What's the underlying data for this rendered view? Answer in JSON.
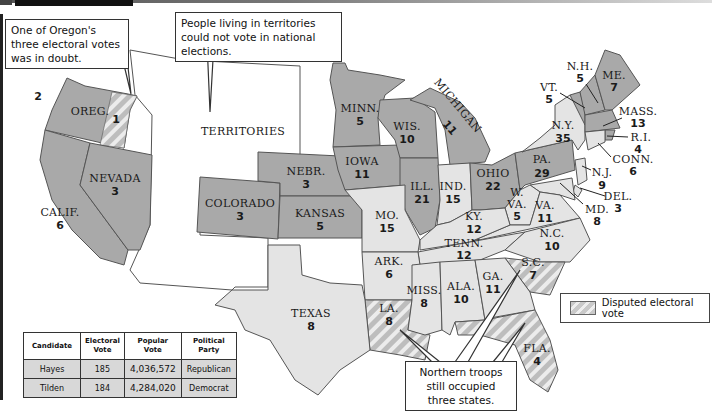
{
  "callouts": {
    "oregon": "One of Oregon's three electoral votes was in doubt.",
    "territories": "People living in territories could not vote in national elections.",
    "troops": "Northern troops still occupied three states."
  },
  "legend": {
    "label": "Disputed electoral vote",
    "swatch": "diagonal-stripe-pattern"
  },
  "colors": {
    "hayes_states": "#a9a9a9",
    "tilden_states": "#e4e4e4",
    "territories": "#ffffff",
    "disputed_stripe": "#c9c9c9"
  },
  "map": {
    "territories_label": "TERRITORIES",
    "states": [
      {
        "abbr": "OREG.",
        "votes": "2",
        "disputed_votes": "1",
        "winner": "Hayes"
      },
      {
        "abbr": "CALIF.",
        "votes": "6",
        "winner": "Hayes"
      },
      {
        "abbr": "NEVADA",
        "votes": "3",
        "winner": "Hayes"
      },
      {
        "abbr": "COLORADO",
        "votes": "3",
        "winner": "Hayes"
      },
      {
        "abbr": "NEBR.",
        "votes": "3",
        "winner": "Hayes"
      },
      {
        "abbr": "KANSAS",
        "votes": "5",
        "winner": "Hayes"
      },
      {
        "abbr": "TEXAS",
        "votes": "8",
        "winner": "Tilden"
      },
      {
        "abbr": "MINN.",
        "votes": "5",
        "winner": "Hayes"
      },
      {
        "abbr": "IOWA",
        "votes": "11",
        "winner": "Hayes"
      },
      {
        "abbr": "MO.",
        "votes": "15",
        "winner": "Tilden"
      },
      {
        "abbr": "ARK.",
        "votes": "6",
        "winner": "Tilden"
      },
      {
        "abbr": "LA.",
        "votes": "8",
        "winner": "Disputed"
      },
      {
        "abbr": "WIS.",
        "votes": "10",
        "winner": "Hayes"
      },
      {
        "abbr": "ILL.",
        "votes": "21",
        "winner": "Hayes"
      },
      {
        "abbr": "MICHIGAN",
        "votes": "11",
        "winner": "Hayes"
      },
      {
        "abbr": "IND.",
        "votes": "15",
        "winner": "Tilden"
      },
      {
        "abbr": "OHIO",
        "votes": "22",
        "winner": "Hayes"
      },
      {
        "abbr": "KY.",
        "votes": "12",
        "winner": "Tilden"
      },
      {
        "abbr": "TENN.",
        "votes": "12",
        "winner": "Tilden"
      },
      {
        "abbr": "MISS.",
        "votes": "8",
        "winner": "Tilden"
      },
      {
        "abbr": "ALA.",
        "votes": "10",
        "winner": "Tilden"
      },
      {
        "abbr": "GA.",
        "votes": "11",
        "winner": "Tilden"
      },
      {
        "abbr": "FLA.",
        "votes": "4",
        "winner": "Disputed"
      },
      {
        "abbr": "S.C.",
        "votes": "7",
        "winner": "Disputed"
      },
      {
        "abbr": "N.C.",
        "votes": "10",
        "winner": "Tilden"
      },
      {
        "abbr": "VA.",
        "votes": "11",
        "winner": "Tilden"
      },
      {
        "abbr": "W. VA.",
        "votes": "5",
        "winner": "Tilden"
      },
      {
        "abbr": "MD.",
        "votes": "8",
        "winner": "Tilden"
      },
      {
        "abbr": "DEL.",
        "votes": "3",
        "winner": "Tilden"
      },
      {
        "abbr": "PA.",
        "votes": "29",
        "winner": "Hayes"
      },
      {
        "abbr": "N.J.",
        "votes": "9",
        "winner": "Tilden"
      },
      {
        "abbr": "N.Y.",
        "votes": "35",
        "winner": "Tilden"
      },
      {
        "abbr": "CONN.",
        "votes": "6",
        "winner": "Tilden"
      },
      {
        "abbr": "R.I.",
        "votes": "4",
        "winner": "Hayes"
      },
      {
        "abbr": "MASS.",
        "votes": "13",
        "winner": "Hayes"
      },
      {
        "abbr": "VT.",
        "votes": "5",
        "winner": "Hayes"
      },
      {
        "abbr": "N.H.",
        "votes": "5",
        "winner": "Hayes"
      },
      {
        "abbr": "ME.",
        "votes": "7",
        "winner": "Hayes"
      }
    ]
  },
  "results_table": {
    "headers": [
      "Candidate",
      "Electoral Vote",
      "Popular Vote",
      "Political Party"
    ],
    "rows": [
      {
        "candidate": "Hayes",
        "electoral": "185",
        "popular": "4,036,572",
        "party": "Republican"
      },
      {
        "candidate": "Tilden",
        "electoral": "184",
        "popular": "4,284,020",
        "party": "Democrat"
      }
    ]
  }
}
